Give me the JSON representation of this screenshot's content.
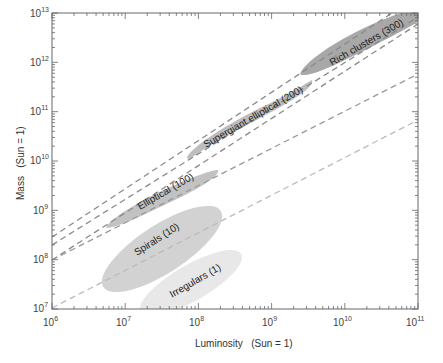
{
  "chart_data": {
    "type": "scatter",
    "title": "",
    "xlabel": "Luminosity   (Sun = 1)",
    "ylabel": "Mass   (Sun = 1)",
    "xscale": "log",
    "yscale": "log",
    "xlim": [
      1000000.0,
      100000000000.0
    ],
    "ylim": [
      10000000.0,
      10000000000000.0
    ],
    "x_ticks": [
      "10^6",
      "10^7",
      "10^8",
      "10^9",
      "10^10",
      "10^11"
    ],
    "y_ticks": [
      "10^7",
      "10^8",
      "10^9",
      "10^10",
      "10^11",
      "10^12",
      "10^13"
    ],
    "grid": false,
    "legend": null,
    "regions": [
      {
        "name": "Irregulars (1)",
        "label": "Irregulars (1)",
        "mass_to_light": 1,
        "luminosity_range": [
          18000000.0,
          180000000.0
        ],
        "mass_range": [
          12000000.0,
          300000000.0
        ],
        "color": "#e6e6e6"
      },
      {
        "name": "Spirals (10)",
        "label": "Spirals (10)",
        "mass_to_light": 10,
        "luminosity_range": [
          6000000.0,
          170000000.0
        ],
        "mass_range": [
          30000000.0,
          1800000000.0
        ],
        "color": "#d0d0d0"
      },
      {
        "name": "Elliptical (100)",
        "label": "Elliptical (100)",
        "mass_to_light": 100,
        "luminosity_range": [
          6000000.0,
          200000000.0
        ],
        "mass_range": [
          500000000.0,
          18000000000.0
        ],
        "color": "#c0c0c0"
      },
      {
        "name": "Supergiant elliptical (200)",
        "label": "Supergiant elliptical (200)",
        "mass_to_light": 200,
        "luminosity_range": [
          70000000.0,
          4000000000.0
        ],
        "mass_range": [
          14000000000.0,
          800000000000.0
        ],
        "color": "#bdbdbd"
      },
      {
        "name": "Rich clusters (300)",
        "label": "Rich clusters (300)",
        "mass_to_light": 300,
        "luminosity_range": [
          3000000000.0,
          100000000000.0
        ],
        "mass_range": [
          800000000000.0,
          15000000000000.0
        ],
        "color": "#a8a8a8"
      }
    ],
    "reference_lines": [
      {
        "mass_to_light": 300,
        "style": "dashed",
        "color": "#888888"
      },
      {
        "mass_to_light": 200,
        "style": "dashed",
        "color": "#888888"
      },
      {
        "mass_to_light": 100,
        "style": "dashed",
        "color": "#888888"
      },
      {
        "mass_to_light": 10,
        "style": "dashed",
        "color": "#999999"
      },
      {
        "mass_to_light": 1,
        "style": "dashed",
        "color": "#bbbbbb"
      }
    ]
  },
  "axes": {
    "x_title": "Luminosity   (Sun = 1)",
    "y_title": "Mass   (Sun = 1)",
    "x_tick_base": [
      "10",
      "10",
      "10",
      "10",
      "10",
      "10"
    ],
    "x_tick_exp": [
      "6",
      "7",
      "8",
      "9",
      "10",
      "11"
    ],
    "y_tick_base": [
      "10",
      "10",
      "10",
      "10",
      "10",
      "10",
      "10"
    ],
    "y_tick_exp": [
      "7",
      "8",
      "9",
      "10",
      "11",
      "12",
      "13"
    ]
  },
  "labels": {
    "irregulars": "Irregulars (1)",
    "spirals": "Spirals (10)",
    "elliptical": "Elliptical (100)",
    "supergiant": "Supergiant elliptical (200)",
    "rich": "Rich clusters (300)"
  }
}
